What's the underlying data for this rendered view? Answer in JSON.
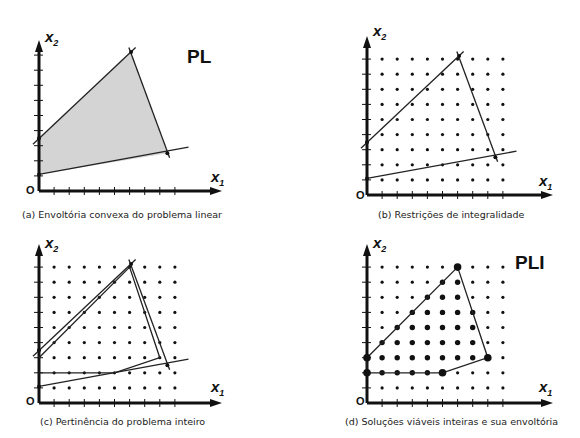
{
  "figure": {
    "grid": {
      "cols": 9,
      "rows": 9,
      "unit_px": 15.1
    },
    "panels": [
      {
        "id": "a",
        "caption": "(a) Envoltória convexa do problema linear",
        "tag": "PL",
        "origin_label": "O",
        "x_label": "x",
        "x_sub": "1",
        "y_label": "x",
        "y_sub": "2",
        "show_dots": false,
        "lp_region": {
          "fill": "#d4d4d4",
          "vertices": [
            [
              0,
              1.1
            ],
            [
              0,
              3.5
            ],
            [
              6.1,
              9.2
            ],
            [
              8.5,
              2.5
            ]
          ]
        },
        "constraint_lines": [
          {
            "from": [
              -0.4,
              3.1
            ],
            "to": [
              6.4,
              9.5
            ]
          },
          {
            "from": [
              0,
              1.1
            ],
            "to": [
              9.9,
              2.9
            ]
          },
          {
            "from": [
              5.95,
              9.5
            ],
            "to": [
              8.65,
              2.2
            ]
          }
        ],
        "inner_hull": null
      },
      {
        "id": "b",
        "caption": "(b) Restrições de integralidade",
        "tag": "",
        "origin_label": "O",
        "x_label": "x",
        "x_sub": "1",
        "y_label": "x",
        "y_sub": "2",
        "show_dots": true,
        "lp_region": null,
        "constraint_lines": [
          {
            "from": [
              -0.4,
              3.1
            ],
            "to": [
              6.4,
              9.5
            ]
          },
          {
            "from": [
              0,
              1.1
            ],
            "to": [
              9.9,
              2.9
            ]
          },
          {
            "from": [
              5.95,
              9.5
            ],
            "to": [
              8.65,
              2.2
            ]
          }
        ],
        "inner_hull": null
      },
      {
        "id": "c",
        "caption": "(c) Pertinência do problema inteiro",
        "tag": "",
        "origin_label": "O",
        "x_label": "x",
        "x_sub": "1",
        "y_label": "x",
        "y_sub": "2",
        "show_dots": true,
        "lp_region": null,
        "constraint_lines": [
          {
            "from": [
              -0.4,
              3.1
            ],
            "to": [
              6.4,
              9.5
            ]
          },
          {
            "from": [
              0,
              1.1
            ],
            "to": [
              9.9,
              2.9
            ]
          },
          {
            "from": [
              5.95,
              9.5
            ],
            "to": [
              8.65,
              2.2
            ]
          }
        ],
        "inner_hull": {
          "vertices": [
            [
              0,
              3
            ],
            [
              6,
              9
            ],
            [
              8,
              3
            ],
            [
              5,
              2
            ],
            [
              0,
              2
            ]
          ],
          "closed": false
        }
      },
      {
        "id": "d",
        "caption": "(d) Soluções viáveis inteiras e sua envoltória",
        "tag": "PLI",
        "origin_label": "O",
        "x_label": "x",
        "x_sub": "1",
        "y_label": "x",
        "y_sub": "2",
        "show_dots": true,
        "lp_region": null,
        "constraint_lines": [],
        "inner_hull": {
          "vertices": [
            [
              0,
              3
            ],
            [
              6,
              9
            ],
            [
              8,
              3
            ],
            [
              5,
              2
            ],
            [
              0,
              2
            ]
          ],
          "closed": true
        },
        "hull_vertices_emphasis": [
          [
            0,
            3
          ],
          [
            6,
            9
          ],
          [
            8,
            3
          ],
          [
            5,
            2
          ],
          [
            0,
            2
          ]
        ],
        "feasible_points": [
          [
            6,
            9
          ],
          [
            5,
            8
          ],
          [
            6,
            8
          ],
          [
            4,
            7
          ],
          [
            5,
            7
          ],
          [
            6,
            7
          ],
          [
            3,
            6
          ],
          [
            4,
            6
          ],
          [
            5,
            6
          ],
          [
            6,
            6
          ],
          [
            7,
            6
          ],
          [
            2,
            5
          ],
          [
            3,
            5
          ],
          [
            4,
            5
          ],
          [
            5,
            5
          ],
          [
            6,
            5
          ],
          [
            7,
            5
          ],
          [
            1,
            4
          ],
          [
            2,
            4
          ],
          [
            3,
            4
          ],
          [
            4,
            4
          ],
          [
            5,
            4
          ],
          [
            6,
            4
          ],
          [
            7,
            4
          ],
          [
            0,
            3
          ],
          [
            1,
            3
          ],
          [
            2,
            3
          ],
          [
            3,
            3
          ],
          [
            4,
            3
          ],
          [
            5,
            3
          ],
          [
            6,
            3
          ],
          [
            7,
            3
          ],
          [
            8,
            3
          ],
          [
            0,
            2
          ],
          [
            1,
            2
          ],
          [
            2,
            2
          ],
          [
            3,
            2
          ],
          [
            4,
            2
          ],
          [
            5,
            2
          ]
        ]
      }
    ]
  }
}
